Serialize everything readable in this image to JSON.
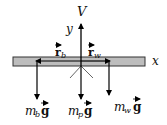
{
  "diagram": {
    "type": "free-body diagram",
    "colors": {
      "bar_fill": "#bdbdbd",
      "bar_stroke": "#333333",
      "arrow": "#000000"
    },
    "axes": {
      "x_label": "x",
      "y_label": "y"
    },
    "forces": {
      "upward": {
        "label": "V"
      },
      "down_left": {
        "mass": "m",
        "sub": "b",
        "vec": "g"
      },
      "down_center": {
        "mass": "m",
        "sub": "p",
        "vec": "g"
      },
      "down_right": {
        "mass": "m",
        "sub": "w",
        "vec": "g"
      }
    },
    "position_vectors": {
      "left": {
        "label": "r",
        "sub": "b"
      },
      "right": {
        "label": "r",
        "sub": "w"
      }
    }
  }
}
